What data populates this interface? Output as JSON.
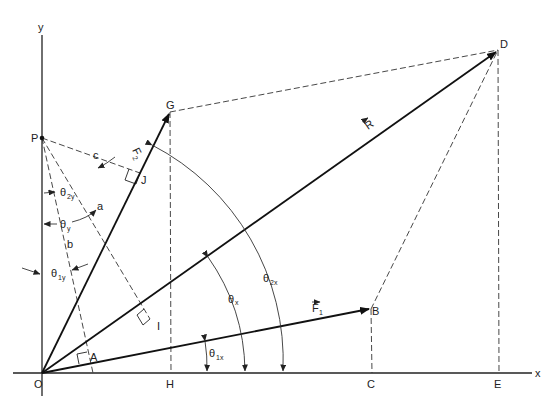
{
  "diagram": {
    "type": "vector force resolution diagram",
    "axes": {
      "x_label": "x",
      "y_label": "y"
    },
    "points": {
      "O": "O",
      "P": "P",
      "G": "G",
      "D": "D",
      "B": "B",
      "H": "H",
      "C": "C",
      "E": "E",
      "J": "J",
      "I": "I",
      "A": "A"
    },
    "vectors": {
      "F1": "F",
      "F1_sub": "1",
      "F2": "F",
      "F2_sub": "2",
      "R": "R"
    },
    "segment_labels": {
      "a": "a",
      "b": "b",
      "c": "c"
    },
    "angles": {
      "theta_1x": {
        "sym": "θ",
        "sub": "1x"
      },
      "theta_x": {
        "sym": "θ",
        "sub": "x"
      },
      "theta_2x": {
        "sym": "θ",
        "sub": "2x"
      },
      "theta_1y": {
        "sym": "θ",
        "sub": "1y"
      },
      "theta_y": {
        "sym": "θ",
        "sub": "y"
      },
      "theta_2y": {
        "sym": "θ",
        "sub": "2y"
      }
    },
    "colors": {
      "ink": "#222222",
      "background": "#ffffff"
    }
  }
}
